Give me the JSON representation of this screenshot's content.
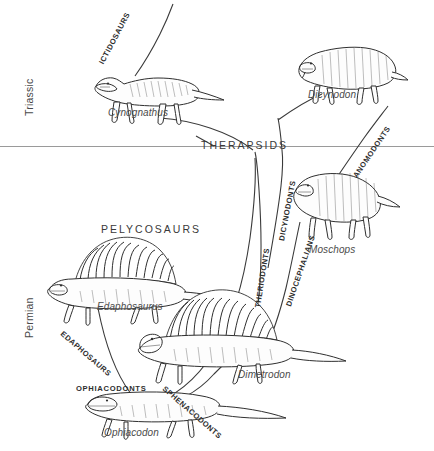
{
  "figure": {
    "width": 434,
    "height": 451,
    "background": "#ffffff",
    "ink": "#303030",
    "boundary_color": "#9a9a9a"
  },
  "time_axis": {
    "periods": [
      {
        "name": "Triassic",
        "x": 18,
        "y": 92
      },
      {
        "name": "Permian",
        "x": 18,
        "y": 320
      }
    ],
    "boundary_y": 146
  },
  "clades": {
    "major": [
      {
        "label": "THERAPSIDS",
        "x": 201,
        "y": 141,
        "rotate": 0
      },
      {
        "label": "PELYCOSAURS",
        "x": 101,
        "y": 224,
        "rotate": 0
      }
    ],
    "branch_labels": [
      {
        "label": "ICTIDOSAURS",
        "x": 98,
        "y": 62,
        "rotate": -62
      },
      {
        "label": "ANOMODONTS",
        "x": 352,
        "y": 175,
        "rotate": -56
      },
      {
        "label": "DICYNODONTS",
        "x": 278,
        "y": 240,
        "rotate": -79
      },
      {
        "label": "THERIODONTS",
        "x": 254,
        "y": 307,
        "rotate": -81
      },
      {
        "label": "DINOCEPHALIANS",
        "x": 285,
        "y": 305,
        "rotate": -71
      },
      {
        "label": "EDAPHOSAURS",
        "x": 64,
        "y": 330,
        "rotate": 41
      },
      {
        "label": "OPHIACODONTS",
        "x": 76,
        "y": 385,
        "rotate": 0
      },
      {
        "label": "SPHENACODONTS",
        "x": 166,
        "y": 385,
        "rotate": 41
      }
    ]
  },
  "genera": [
    {
      "name": "Cynognathus",
      "x": 108,
      "y": 108
    },
    {
      "name": "Dicynodon",
      "x": 308,
      "y": 90
    },
    {
      "name": "Moschops",
      "x": 309,
      "y": 245
    },
    {
      "name": "Edaphosaurus",
      "x": 97,
      "y": 302
    },
    {
      "name": "Dimetrodon",
      "x": 238,
      "y": 370
    },
    {
      "name": "Ophiacodon",
      "x": 104,
      "y": 428
    }
  ]
}
